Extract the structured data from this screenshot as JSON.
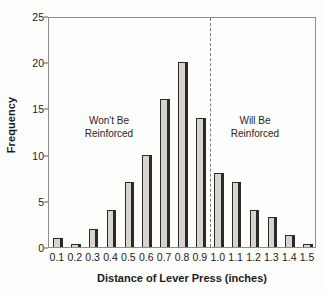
{
  "chart_data": {
    "type": "bar",
    "title": "",
    "xlabel": "Distance of Lever Press (inches)",
    "ylabel": "Frequency",
    "categories": [
      "0.1",
      "0.2",
      "0.3",
      "0.4",
      "0.5",
      "0.6",
      "0.7",
      "0.8",
      "0.9",
      "1.0",
      "1.1",
      "1.2",
      "1.3",
      "1.4",
      "1.5"
    ],
    "values": [
      1,
      0.3,
      2,
      4,
      7,
      10,
      16,
      20,
      14,
      8,
      7,
      4,
      3.3,
      1.3,
      0.3
    ],
    "ylim": [
      0,
      25
    ],
    "yticks": [
      0,
      5,
      10,
      15,
      20,
      25
    ],
    "ytick_labels": [
      "0",
      "5",
      "10",
      "15",
      "20",
      "25"
    ],
    "grid": false,
    "legend_position": "none",
    "annotations": [
      {
        "text_line1": "Won't Be",
        "text_line2": "Reinforced",
        "side": "left"
      },
      {
        "text_line1": "Will Be",
        "text_line2": "Reinforced",
        "side": "right"
      }
    ],
    "reference_line": {
      "style": "dashed",
      "orientation": "vertical",
      "between_categories": [
        "0.9",
        "1.0"
      ]
    },
    "colors": {
      "bar_fill": "#d6d4cd",
      "bar_edge": "#2a2a2a",
      "axis": "#8d8d8a",
      "text": "#1b1b1b",
      "reference_line": "#7a7a78",
      "background": "#fdfdfb"
    }
  }
}
